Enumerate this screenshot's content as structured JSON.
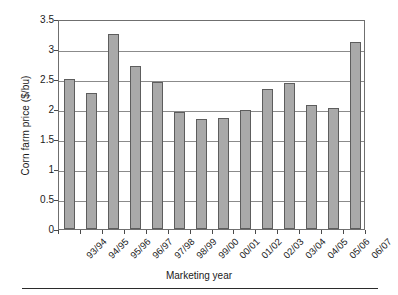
{
  "chart_data": {
    "type": "bar",
    "title": "",
    "xlabel": "Marketing year",
    "ylabel": "Corn farm price ($/bu)",
    "categories": [
      "93/94",
      "94/95",
      "95/96",
      "96/97",
      "97/98",
      "98/99",
      "99/00",
      "00/01",
      "01/02",
      "02/03",
      "03/04",
      "04/05",
      "05/06",
      "06/07"
    ],
    "values": [
      2.5,
      2.27,
      3.25,
      2.72,
      2.45,
      1.95,
      1.83,
      1.85,
      1.98,
      2.33,
      2.43,
      2.07,
      2.01,
      3.11
    ],
    "ylim": [
      0,
      3.5
    ],
    "ytick_labels": [
      "0",
      "0.5",
      "1",
      "1.5",
      "2",
      "2.5",
      "3",
      "3.5"
    ],
    "ytick_values": [
      0,
      0.5,
      1,
      1.5,
      2,
      2.5,
      3,
      3.5
    ],
    "grid": "horizontal",
    "legend": "none",
    "bar_color": "#a9a9a9",
    "bar_border_color": "#5d5d5d",
    "gridline_color": "#8b8b8b",
    "axis_color": "#6f6f6f"
  }
}
